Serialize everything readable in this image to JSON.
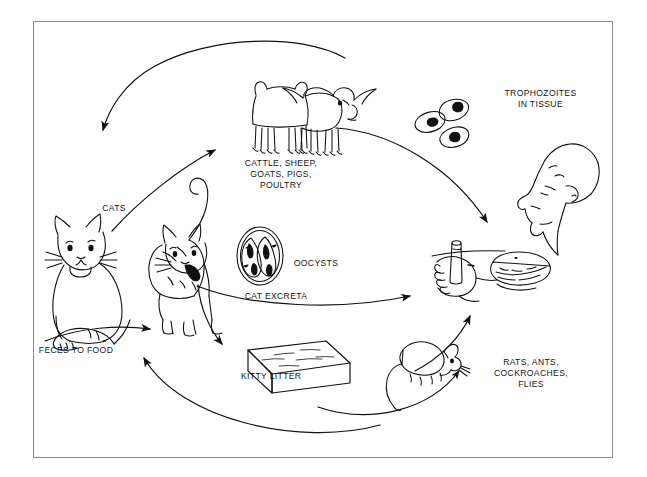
{
  "figure": {
    "kind": "life-cycle-diagram",
    "frame": {
      "border_color": "#8d8d8d",
      "background": "#ffffff"
    },
    "line_color": "#111111"
  },
  "labels": {
    "cattle": "CATTLE, SHEEP,\nGOATS, PIGS,\nPOULTRY",
    "trophozoites": "TROPHOZOITES\nIN TISSUE",
    "cats": "CATS",
    "oocysts": "OOCYSTS",
    "cat_excreta": "CAT EXCRETA",
    "feces_to_food": "FECES TO FOOD",
    "kitty_litter": "KITTY LITTER",
    "vermin": "RATS, ANTS,\nCOCKROACHES,\nFLIES"
  },
  "nodes": [
    {
      "id": "sitting-cat",
      "name": "sitting-cat-illustration"
    },
    {
      "id": "standing-cat",
      "name": "standing-cat-illustration"
    },
    {
      "id": "cattle",
      "name": "cattle-illustration"
    },
    {
      "id": "trophozoites",
      "name": "trophozoites-illustration"
    },
    {
      "id": "human",
      "name": "human-eating-illustration"
    },
    {
      "id": "oocyst",
      "name": "oocyst-illustration"
    },
    {
      "id": "litter-box",
      "name": "kitty-litter-box-illustration"
    },
    {
      "id": "rodent",
      "name": "rodent-illustration"
    }
  ],
  "arrows": [
    {
      "id": "a1",
      "name": "arrow-cattle-to-cats",
      "from": "cattle",
      "to": "sitting-cat"
    },
    {
      "id": "a2",
      "name": "arrow-cats-to-cattle",
      "from": "standing-cat",
      "to": "cattle"
    },
    {
      "id": "a3",
      "name": "arrow-cattle-to-human",
      "from": "cattle",
      "to": "human"
    },
    {
      "id": "a4",
      "name": "arrow-excreta-to-human",
      "from": "oocysts",
      "to": "human"
    },
    {
      "id": "a5",
      "name": "arrow-cat-to-litter",
      "from": "standing-cat",
      "to": "litter-box"
    },
    {
      "id": "a6",
      "name": "arrow-litter-to-feces-food",
      "from": "litter-box",
      "to": "feces-to-food"
    },
    {
      "id": "a7",
      "name": "arrow-feces-food-to-cat",
      "from": "feces-to-food",
      "to": "standing-cat"
    },
    {
      "id": "a8",
      "name": "arrow-rodent-to-human",
      "from": "rodent",
      "to": "human"
    }
  ]
}
